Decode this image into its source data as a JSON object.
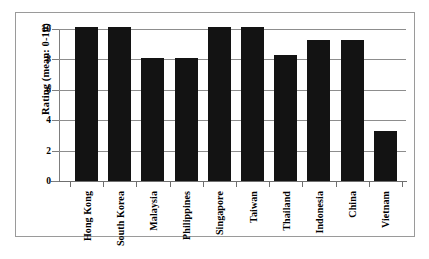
{
  "chart_data": {
    "type": "bar",
    "title": "",
    "xlabel": "",
    "ylabel": "Rating (mean: 0-10)",
    "ylim": [
      0,
      10
    ],
    "yticks": [
      "0",
      "2",
      "4",
      "6",
      "8",
      "10"
    ],
    "grid": true,
    "legend": false,
    "bar_color": "#131313",
    "gridline_color": "#8d8d8d",
    "axis_color": "#6f6f6f",
    "border_color": "#9a9a9a",
    "categories": [
      "Hong Kong",
      "South Korea",
      "Malaysia",
      "Philippines",
      "Singapore",
      "Taiwan",
      "Thailand",
      "Indonesia",
      "China",
      "Vietnam"
    ],
    "values": [
      10.1,
      10.1,
      8.1,
      8.1,
      10.1,
      10.1,
      8.3,
      9.3,
      9.3,
      3.3
    ]
  }
}
